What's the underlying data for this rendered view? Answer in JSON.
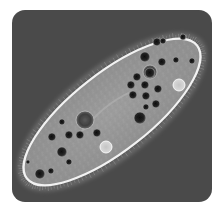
{
  "image": {
    "subject": "Paramecium (ciliate protozoan) micrograph",
    "description": "Phase-contrast microscopy image of an elongated oval paramecium lying diagonally on a dark gray rounded-square background, showing cilia along the edge, dark food vacuoles and pale contractile vacuoles.",
    "colors": {
      "page_background": "#ffffff",
      "panel_background": "#4a4a4a",
      "cell_body": "#9a9a9a",
      "cell_membrane": "#f2f2f2",
      "food_vacuole": "#1e1e1e",
      "contractile_vacuole": "#d8d8d8"
    },
    "cell": {
      "center_x": 112,
      "center_y": 112,
      "length": 216,
      "width": 78,
      "rotation_deg": -38
    },
    "vacuoles": [
      {
        "x": 145,
        "y": 57,
        "r": 5
      },
      {
        "x": 157,
        "y": 42,
        "r": 4
      },
      {
        "x": 162,
        "y": 62,
        "r": 4
      },
      {
        "x": 176,
        "y": 60,
        "r": 3
      },
      {
        "x": 150,
        "y": 73,
        "r": 5
      },
      {
        "x": 137,
        "y": 77,
        "r": 4
      },
      {
        "x": 131,
        "y": 85,
        "r": 4
      },
      {
        "x": 145,
        "y": 85,
        "r": 4
      },
      {
        "x": 158,
        "y": 89,
        "r": 4
      },
      {
        "x": 133,
        "y": 95,
        "r": 4
      },
      {
        "x": 146,
        "y": 96,
        "r": 4
      },
      {
        "x": 156,
        "y": 104,
        "r": 4
      },
      {
        "x": 146,
        "y": 107,
        "r": 3
      },
      {
        "x": 140,
        "y": 118,
        "r": 6
      },
      {
        "x": 62,
        "y": 122,
        "r": 3
      },
      {
        "x": 69,
        "y": 135,
        "r": 4
      },
      {
        "x": 52,
        "y": 137,
        "r": 4
      },
      {
        "x": 80,
        "y": 135,
        "r": 4
      },
      {
        "x": 97,
        "y": 133,
        "r": 4
      },
      {
        "x": 62,
        "y": 152,
        "r": 5
      },
      {
        "x": 69,
        "y": 162,
        "r": 3
      },
      {
        "x": 51,
        "y": 171,
        "r": 3
      },
      {
        "x": 40,
        "y": 174,
        "r": 5
      },
      {
        "x": 28,
        "y": 162,
        "r": 2
      },
      {
        "x": 163,
        "y": 41,
        "r": 3
      },
      {
        "x": 183,
        "y": 37,
        "r": 3
      },
      {
        "x": 192,
        "y": 61,
        "r": 3
      }
    ],
    "large_vacuoles": [
      {
        "x": 85,
        "y": 120,
        "r": 9
      },
      {
        "x": 150,
        "y": 72,
        "r": 7
      }
    ],
    "contractile_vacuoles": [
      {
        "x": 179,
        "y": 85,
        "r": 6
      },
      {
        "x": 106,
        "y": 147,
        "r": 6
      }
    ]
  }
}
